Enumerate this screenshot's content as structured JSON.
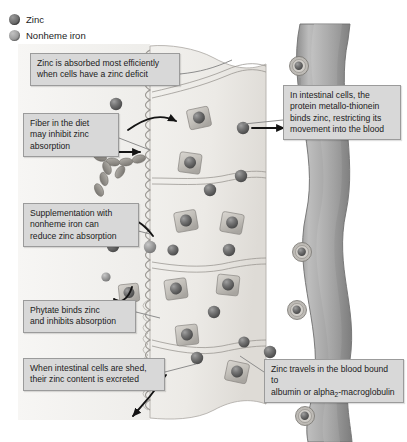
{
  "figure": {
    "background_color": "#ffffff"
  },
  "legend": {
    "items": [
      {
        "label": "Zinc",
        "icon": "zinc-sphere-icon",
        "color": "#767676"
      },
      {
        "label": "Nonheme iron",
        "icon": "iron-sphere-icon",
        "color": "#a3a3a3"
      }
    ]
  },
  "callouts": {
    "deficit": "Zinc is absorbed most efficiently\nwhen cells have a zinc deficit",
    "fiber": "Fiber in the diet\nmay inhibit zinc\nabsorption",
    "iron": "Supplementation with\nnonheme iron can\nreduce zinc absorption",
    "phytate": "Phytate binds zinc\nand inhibits absorption",
    "shed": "When intestinal cells are shed,\ntheir zinc content is excreted",
    "metallothionein": "In intestinal cells, the\nprotein metallo-thionein\nbinds zinc, restricting its\nmovement into the blood",
    "transport_pre": "Zinc travels in the blood bound to\nalbumin or alpha",
    "transport_sub": "2",
    "transport_post": "-macroglobulin"
  },
  "structures": {
    "intestinal_lumen": "intestinal-lumen",
    "microvilli": "microvilli-brush-border",
    "intestinal_cells": "intestinal-epithelial-cells",
    "blood_vessel": "blood-vessel",
    "metallothionein_units": "metallothionein-bound-zinc",
    "fiber_chain": "dietary-fiber-chain",
    "phytate_molecule": "phytate-molecule",
    "shed_cell_arrow": "shed-cell-arrow"
  },
  "colors": {
    "callout_bg": "#d8d8d8",
    "callout_border": "#9b9b9b",
    "cell_fill": "#eceae6",
    "lumen_fill": "#f4f3f1",
    "vessel_fill": "#a9a9a9",
    "zinc": "#767676",
    "iron": "#a3a3a3",
    "arrow": "#141414",
    "leader": "#8d8d8d"
  }
}
